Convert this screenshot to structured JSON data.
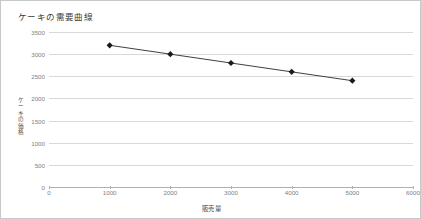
{
  "chart_data": {
    "type": "line",
    "title": "ケーキの需要曲線",
    "xlabel": "販売量",
    "ylabel": "ケーキの価格",
    "x": [
      1000,
      2000,
      3000,
      4000,
      5000
    ],
    "values": [
      3200,
      3000,
      2800,
      2600,
      2400
    ],
    "series": [
      {
        "name": "ケーキの需要曲線",
        "values": [
          3200,
          3000,
          2800,
          2600,
          2400
        ]
      }
    ],
    "xlim": [
      0,
      6000
    ],
    "ylim": [
      0,
      3500
    ],
    "xticks": [
      0,
      1000,
      2000,
      3000,
      4000,
      5000,
      6000
    ],
    "yticks": [
      0,
      500,
      1000,
      1500,
      2000,
      2500,
      3000,
      3500
    ],
    "xtick_labels": [
      "0",
      "1000",
      "2000",
      "3000",
      "4000",
      "5000",
      "6000"
    ],
    "ytick_labels": [
      "0",
      "500",
      "1000",
      "1500",
      "2000",
      "2500",
      "3000",
      "3500"
    ],
    "grid": true,
    "legend": false,
    "marker": "diamond",
    "line_color": "#404040",
    "marker_color": "#1a1a1a",
    "grid_color": "#d9d9d9",
    "border_color": "#c8c8c8"
  }
}
